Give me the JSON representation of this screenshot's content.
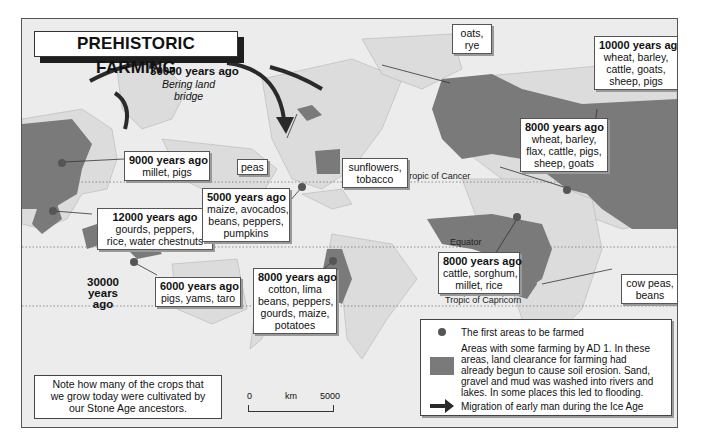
{
  "title": "PREHISTORIC FARMING",
  "migration_labels": {
    "bering": {
      "years": "30000 years ago",
      "place_line1": "Bering land",
      "place_line2": "bridge"
    },
    "australia": {
      "line1": "30000",
      "line2": "years",
      "line3": "ago"
    }
  },
  "reference_lines": {
    "tropic_cancer": "Tropic of Cancer",
    "equator": "Equator",
    "tropic_capricorn": "Tropic of Capricorn"
  },
  "callouts": {
    "china": {
      "years": "9000 years ago",
      "items": "millet, pigs"
    },
    "se_asia": {
      "years": "12000 years ago",
      "line1": "gourds, peppers,",
      "line2": "rice, water chestnuts"
    },
    "new_guinea": {
      "years": "6000 years ago",
      "items": "pigs, yams, taro"
    },
    "mexico": {
      "years": "5000 years ago",
      "line1": "maize, avocados,",
      "line2": "beans, peppers,",
      "line3": "pumpkins"
    },
    "andes": {
      "years": "8000 years ago",
      "line1": "cotton, lima",
      "line2": "beans, peppers,",
      "line3": "gourds, maize,",
      "line4": "potatoes"
    },
    "peas": {
      "items": "peas"
    },
    "north_america": {
      "line1": "sunflowers,",
      "line2": "tobacco"
    },
    "northern_europe": {
      "line1": "oats,",
      "line2": "rye"
    },
    "fertile_crescent": {
      "years": "10000 years ago",
      "line1": "wheat, barley,",
      "line2": "cattle, goats,",
      "line3": "sheep, pigs"
    },
    "egypt": {
      "years": "8000 years ago",
      "line1": "wheat, barley,",
      "line2": "flax, cattle, pigs,",
      "line3": "sheep, goats"
    },
    "west_africa": {
      "years": "8000 years ago",
      "line1": "cattle, sorghum,",
      "line2": "millet, rice"
    },
    "east_africa": {
      "line1": "cow peas,",
      "line2": "beans"
    }
  },
  "legend": {
    "first_areas": "The first areas to be farmed",
    "farming_line1": "Areas with some farming by AD 1.  In these",
    "farming_line2": "areas, land clearance for farming had",
    "farming_line3": "already begun to cause soil erosion.  Sand,",
    "farming_line4": "gravel and mud was washed into rivers and",
    "farming_line5": "lakes.  In some places this led to flooding.",
    "migration": "Migration of early man during the Ice Age"
  },
  "note": {
    "line1": "Note how many of the crops that",
    "line2": "we grow today were cultivated by",
    "line3": "our Stone Age ancestors."
  },
  "scale_bar": {
    "start": "0",
    "unit": "km",
    "end": "5000"
  },
  "colors": {
    "farmed": "#7a7a7a",
    "land": "#dcdcdc",
    "sea": "#ececec",
    "dot": "#555555",
    "arrow": "#2a2a2a"
  }
}
